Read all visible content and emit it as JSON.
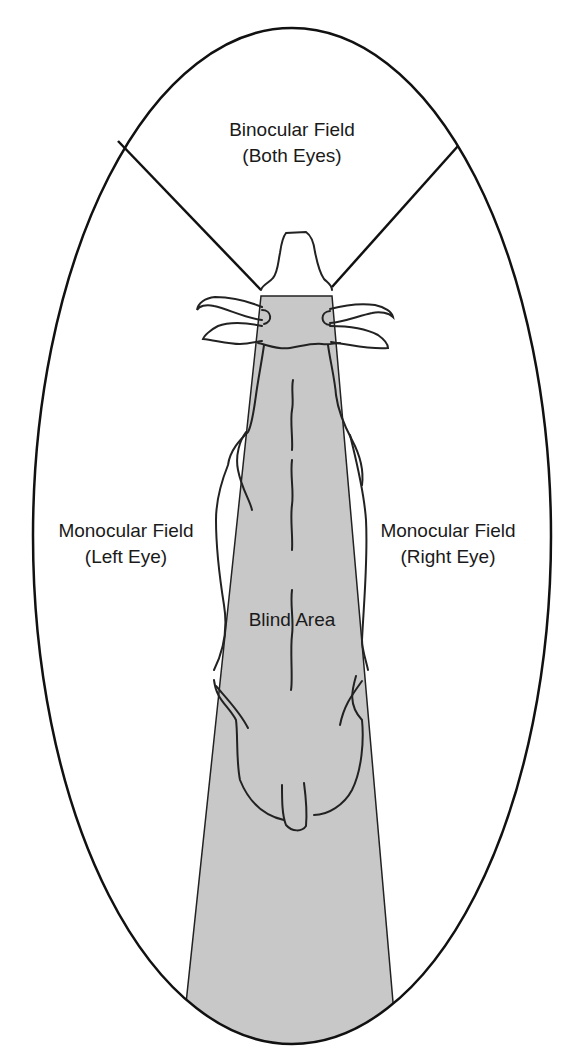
{
  "diagram": {
    "colors": {
      "outline": "#111111",
      "blind_area_fill": "#c8c8c8",
      "background": "#ffffff"
    },
    "regions": {
      "binocular": {
        "line1": "Binocular Field",
        "line2": "(Both Eyes)"
      },
      "monocular_left": {
        "line1": "Monocular Field",
        "line2": "(Left Eye)"
      },
      "monocular_right": {
        "line1": "Monocular Field",
        "line2": "(Right Eye)"
      },
      "blind": {
        "label": "Blind Area"
      }
    }
  }
}
